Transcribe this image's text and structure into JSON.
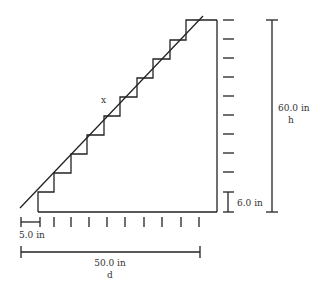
{
  "diagram": {
    "labels": {
      "hypotenuse": "x",
      "riser_height": "6.0 in",
      "total_height_value": "60.0 in",
      "total_height_var": "h",
      "tread_depth": "5.0 in",
      "total_depth_value": "50.0 in",
      "total_depth_var": "d"
    },
    "stair": {
      "num_steps": 10,
      "riser_in": 6.0,
      "tread_in": 5.0,
      "total_height_in": 60.0,
      "total_depth_in": 50.0
    },
    "colors": {
      "line": "#222222",
      "text": "#333333",
      "background": "#ffffff"
    }
  }
}
